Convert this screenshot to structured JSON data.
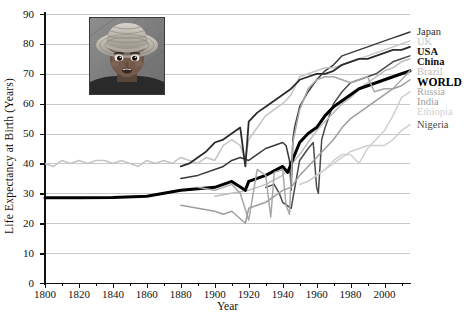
{
  "chart_data": {
    "type": "line",
    "title": "",
    "xlabel": "Year",
    "ylabel": "Life Expectancy at Birth (Years)",
    "xlim": [
      1800,
      2015
    ],
    "ylim": [
      0,
      90
    ],
    "xticks": [
      1800,
      1820,
      1840,
      1860,
      1880,
      1900,
      1920,
      1940,
      1960,
      1980,
      2000
    ],
    "xtick_labels": [
      "1800",
      "1820",
      "1840",
      "1860",
      "1880",
      "1900",
      "1920",
      "1940",
      "1960",
      "1980",
      "2000"
    ],
    "xminor_step": 10,
    "yticks": [
      0,
      10,
      20,
      30,
      40,
      50,
      60,
      70,
      80,
      90
    ],
    "ytick_labels": [
      "0",
      "10",
      "20",
      "30",
      "40",
      "50",
      "60",
      "70",
      "80",
      "90"
    ],
    "grid": "horizontal",
    "legend_position": "right-outside",
    "legend_entries": [
      "Japan",
      "UK",
      "USA",
      "China",
      "Brazil",
      "WORLD",
      "Russia",
      "India",
      "Ethiopia",
      "Nigeria"
    ],
    "series": [
      {
        "name": "Japan",
        "color": "#3a3a3a",
        "width": 1.5,
        "bold_label": false,
        "end_value": 84,
        "x": [
          1880,
          1890,
          1900,
          1905,
          1910,
          1915,
          1920,
          1925,
          1930,
          1935,
          1940,
          1942,
          1944,
          1945,
          1946,
          1947,
          1950,
          1955,
          1960,
          1965,
          1970,
          1975,
          1980,
          1985,
          1990,
          1995,
          2000,
          2005,
          2010,
          2015
        ],
        "values": [
          35,
          36,
          38,
          39,
          41,
          42,
          41,
          43,
          45,
          46,
          47,
          46,
          41,
          31,
          48,
          52,
          59,
          64,
          68,
          71,
          73,
          76,
          77,
          78,
          79,
          80,
          81,
          82,
          83,
          84
        ]
      },
      {
        "name": "UK",
        "color": "#c4c4c4",
        "width": 1.5,
        "bold_label": false,
        "end_value": 81,
        "x": [
          1800,
          1805,
          1810,
          1815,
          1820,
          1825,
          1830,
          1835,
          1840,
          1845,
          1850,
          1855,
          1860,
          1865,
          1870,
          1875,
          1880,
          1885,
          1890,
          1895,
          1900,
          1905,
          1910,
          1915,
          1918,
          1920,
          1925,
          1930,
          1935,
          1940,
          1945,
          1950,
          1955,
          1960,
          1965,
          1970,
          1975,
          1980,
          1985,
          1990,
          1995,
          2000,
          2005,
          2010,
          2015
        ],
        "values": [
          40,
          39,
          41,
          40,
          41,
          40,
          41,
          41,
          40,
          41,
          40,
          39,
          41,
          40,
          41,
          40,
          42,
          41,
          40,
          42,
          41,
          46,
          48,
          46,
          41,
          48,
          52,
          56,
          58,
          60,
          63,
          69,
          70,
          71,
          72,
          72,
          73,
          74,
          75,
          76,
          77,
          78,
          79,
          80,
          81
        ]
      },
      {
        "name": "USA",
        "color": "#2b2b2b",
        "width": 1.8,
        "bold_label": true,
        "end_value": 79,
        "x": [
          1880,
          1885,
          1890,
          1895,
          1900,
          1905,
          1910,
          1915,
          1918,
          1920,
          1925,
          1930,
          1935,
          1940,
          1945,
          1950,
          1955,
          1960,
          1965,
          1970,
          1975,
          1980,
          1985,
          1990,
          1995,
          2000,
          2005,
          2010,
          2015
        ],
        "values": [
          39,
          40,
          42,
          44,
          47,
          48,
          50,
          52,
          39,
          54,
          57,
          59,
          61,
          63,
          65,
          68,
          69,
          70,
          70,
          71,
          73,
          74,
          75,
          75,
          76,
          77,
          78,
          78,
          79
        ]
      },
      {
        "name": "China",
        "color": "#4a4a4a",
        "width": 1.5,
        "bold_label": true,
        "end_value": 76,
        "x": [
          1930,
          1935,
          1938,
          1940,
          1945,
          1950,
          1955,
          1958,
          1960,
          1961,
          1963,
          1965,
          1970,
          1975,
          1980,
          1985,
          1990,
          1995,
          2000,
          2005,
          2010,
          2015
        ],
        "values": [
          32,
          33,
          30,
          27,
          25,
          41,
          45,
          47,
          32,
          30,
          48,
          52,
          60,
          64,
          67,
          68,
          69,
          70,
          72,
          74,
          75,
          76
        ]
      },
      {
        "name": "Brazil",
        "color": "#bdbdbd",
        "width": 1.5,
        "bold_label": false,
        "end_value": 75,
        "x": [
          1900,
          1910,
          1920,
          1930,
          1940,
          1950,
          1955,
          1960,
          1965,
          1970,
          1975,
          1980,
          1985,
          1990,
          1995,
          2000,
          2005,
          2010,
          2015
        ],
        "values": [
          29,
          30,
          31,
          33,
          36,
          43,
          47,
          51,
          54,
          57,
          60,
          62,
          65,
          67,
          69,
          71,
          72,
          74,
          75
        ]
      },
      {
        "name": "WORLD",
        "color": "#000000",
        "width": 3.0,
        "bold_label": true,
        "end_value": 71,
        "x": [
          1800,
          1820,
          1840,
          1860,
          1870,
          1880,
          1890,
          1900,
          1910,
          1918,
          1920,
          1930,
          1940,
          1943,
          1945,
          1950,
          1955,
          1960,
          1965,
          1970,
          1975,
          1980,
          1985,
          1990,
          1995,
          2000,
          2005,
          2010,
          2015
        ],
        "values": [
          28.5,
          28.5,
          28.6,
          29,
          30,
          31,
          31.5,
          32,
          34,
          31,
          34,
          36,
          39,
          37,
          40,
          47,
          50,
          52,
          56,
          59,
          61,
          63,
          65,
          66,
          67,
          68,
          69,
          70,
          71
        ]
      },
      {
        "name": "Russia",
        "color": "#a8a8a8",
        "width": 1.5,
        "bold_label": false,
        "end_value": 71,
        "x": [
          1890,
          1900,
          1910,
          1915,
          1920,
          1925,
          1930,
          1933,
          1935,
          1940,
          1942,
          1944,
          1946,
          1950,
          1955,
          1960,
          1965,
          1970,
          1975,
          1980,
          1985,
          1990,
          1994,
          2000,
          2005,
          2010,
          2015
        ],
        "values": [
          32,
          31,
          33,
          30,
          21,
          38,
          36,
          22,
          37,
          38,
          26,
          23,
          47,
          58,
          65,
          68,
          69,
          69,
          68,
          67,
          68,
          69,
          64,
          65,
          65,
          68,
          71
        ]
      },
      {
        "name": "India",
        "color": "#9e9e9e",
        "width": 1.5,
        "bold_label": false,
        "end_value": 68,
        "x": [
          1880,
          1890,
          1900,
          1905,
          1910,
          1918,
          1920,
          1930,
          1940,
          1945,
          1950,
          1955,
          1960,
          1965,
          1970,
          1975,
          1980,
          1985,
          1990,
          1995,
          2000,
          2005,
          2010,
          2015
        ],
        "values": [
          26,
          25,
          24,
          23,
          24,
          20,
          25,
          27,
          31,
          32,
          36,
          39,
          42,
          45,
          48,
          52,
          55,
          57,
          59,
          61,
          63,
          65,
          66,
          68
        ]
      },
      {
        "name": "Ethiopia",
        "color": "#d0d0d0",
        "width": 1.5,
        "bold_label": false,
        "end_value": 64,
        "x": [
          1950,
          1955,
          1960,
          1965,
          1970,
          1975,
          1980,
          1985,
          1990,
          1995,
          2000,
          2005,
          2010,
          2015
        ],
        "values": [
          33,
          34,
          36,
          38,
          41,
          43,
          43,
          40,
          45,
          48,
          51,
          56,
          62,
          64
        ]
      },
      {
        "name": "Nigeria",
        "color": "#cfcfcf",
        "width": 1.5,
        "bold_label": false,
        "end_value": 53,
        "x": [
          1950,
          1955,
          1960,
          1965,
          1970,
          1975,
          1980,
          1985,
          1990,
          1995,
          2000,
          2005,
          2010,
          2015
        ],
        "values": [
          33,
          34,
          36,
          38,
          40,
          42,
          44,
          45,
          46,
          46,
          46,
          48,
          51,
          53
        ]
      }
    ]
  },
  "inset_photo": {
    "name": "child-portrait-photo",
    "description": "Grayscale photograph of a young child wearing a woven sun hat"
  }
}
